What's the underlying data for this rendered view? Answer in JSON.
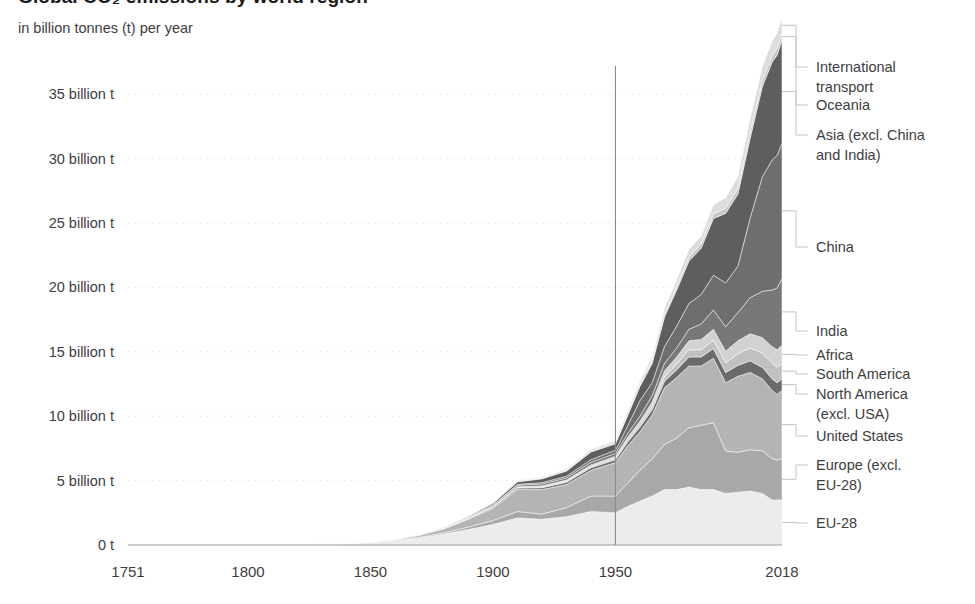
{
  "header": {
    "title": "Global CO₂ emissions by world region",
    "subtitle": "in billion tonnes (t) per year"
  },
  "axes": {
    "y_ticks": [
      {
        "value": 0,
        "label": "0 t"
      },
      {
        "value": 5,
        "label": "5 billion t"
      },
      {
        "value": 10,
        "label": "10 billion t"
      },
      {
        "value": 15,
        "label": "15 billion t"
      },
      {
        "value": 20,
        "label": "20 billion t"
      },
      {
        "value": 25,
        "label": "25 billion t"
      },
      {
        "value": 30,
        "label": "30 billion t"
      },
      {
        "value": 35,
        "label": "35 billion t"
      }
    ],
    "x_ticks": [
      {
        "value": 1751,
        "label": "1751"
      },
      {
        "value": 1800,
        "label": "1800"
      },
      {
        "value": 1850,
        "label": "1850"
      },
      {
        "value": 1900,
        "label": "1900"
      },
      {
        "value": 1950,
        "label": "1950"
      },
      {
        "value": 2018,
        "label": "2018"
      }
    ],
    "xlim": [
      1751,
      2018
    ],
    "ylim": [
      0,
      37.5
    ],
    "marker_year": 1950,
    "grid": true
  },
  "legend": {
    "position": "right",
    "entries": [
      {
        "key": "international_transport",
        "label": "International transport",
        "color": "#dcdcdc",
        "label_y": 72
      },
      {
        "key": "oceania",
        "label": "Oceania",
        "color": "#c7c7c7",
        "label_y": 110
      },
      {
        "key": "asia_other",
        "label": "Asia (excl. China and India)",
        "color": "#5e5e5e",
        "label_y": 140
      },
      {
        "key": "china",
        "label": "China",
        "color": "#6e6e6e",
        "label_y": 252
      },
      {
        "key": "india",
        "label": "India",
        "color": "#787878",
        "label_y": 336
      },
      {
        "key": "africa",
        "label": "Africa",
        "color": "#d2d2d2",
        "label_y": 360
      },
      {
        "key": "south_america",
        "label": "South America",
        "color": "#c0c0c0",
        "label_y": 379
      },
      {
        "key": "north_america",
        "label": "North America (excl. USA)",
        "color": "#6b6b6b",
        "label_y": 399
      },
      {
        "key": "united_states",
        "label": "United States",
        "color": "#b4b4b4",
        "label_y": 441
      },
      {
        "key": "europe_other",
        "label": "Europe (excl. EU-28)",
        "color": "#a8a8a8",
        "label_y": 470
      },
      {
        "key": "eu28",
        "label": "EU-28",
        "color": "#ececec",
        "label_y": 528
      }
    ]
  },
  "chart_data": {
    "type": "area",
    "title": "Global CO₂ emissions by world region",
    "subtitle": "in billion tonnes (t) per year",
    "xlabel": "",
    "ylabel": "in billion tonnes (t) per year",
    "xlim": [
      1751,
      2018
    ],
    "ylim": [
      0,
      37.5
    ],
    "stacked": true,
    "grid": true,
    "legend_position": "right",
    "x": [
      1751,
      1800,
      1820,
      1840,
      1850,
      1860,
      1870,
      1880,
      1890,
      1900,
      1910,
      1920,
      1930,
      1940,
      1950,
      1955,
      1960,
      1965,
      1970,
      1975,
      1980,
      1985,
      1990,
      1995,
      2000,
      2005,
      2010,
      2014,
      2016,
      2018
    ],
    "series": [
      {
        "name": "EU-28",
        "color": "#ececec",
        "values": [
          0.01,
          0.03,
          0.05,
          0.12,
          0.2,
          0.35,
          0.55,
          0.85,
          1.2,
          1.6,
          2.1,
          2.0,
          2.2,
          2.6,
          2.5,
          3.0,
          3.4,
          3.8,
          4.3,
          4.3,
          4.5,
          4.3,
          4.3,
          4.0,
          4.1,
          4.2,
          4.0,
          3.5,
          3.5,
          3.5
        ]
      },
      {
        "name": "Europe (excl. EU-28)",
        "color": "#a8a8a8",
        "values": [
          0.0,
          0.0,
          0.0,
          0.01,
          0.02,
          0.04,
          0.06,
          0.1,
          0.2,
          0.3,
          0.5,
          0.4,
          0.7,
          1.2,
          1.3,
          1.8,
          2.4,
          2.9,
          3.5,
          4.0,
          4.6,
          5.0,
          5.2,
          3.3,
          3.1,
          3.2,
          3.3,
          3.2,
          3.1,
          3.2
        ]
      },
      {
        "name": "United States",
        "color": "#b4b4b4",
        "values": [
          0.0,
          0.0,
          0.0,
          0.01,
          0.02,
          0.06,
          0.15,
          0.3,
          0.6,
          0.95,
          1.7,
          1.9,
          1.8,
          2.0,
          2.6,
          2.9,
          3.0,
          3.4,
          4.4,
          4.7,
          4.8,
          4.6,
          5.0,
          5.3,
          5.9,
          6.0,
          5.6,
          5.3,
          5.1,
          5.3
        ]
      },
      {
        "name": "North America (excl. USA)",
        "color": "#6b6b6b",
        "values": [
          0.0,
          0.0,
          0.0,
          0.0,
          0.0,
          0.01,
          0.02,
          0.03,
          0.05,
          0.08,
          0.12,
          0.15,
          0.17,
          0.2,
          0.22,
          0.3,
          0.35,
          0.4,
          0.5,
          0.6,
          0.7,
          0.7,
          0.75,
          0.8,
          0.85,
          0.9,
          0.9,
          0.9,
          0.9,
          0.9
        ]
      },
      {
        "name": "South America",
        "color": "#c0c0c0",
        "values": [
          0.0,
          0.0,
          0.0,
          0.0,
          0.0,
          0.0,
          0.01,
          0.01,
          0.02,
          0.03,
          0.05,
          0.07,
          0.08,
          0.1,
          0.12,
          0.16,
          0.2,
          0.26,
          0.35,
          0.45,
          0.55,
          0.55,
          0.65,
          0.75,
          0.9,
          1.0,
          1.1,
          1.2,
          1.2,
          1.2
        ]
      },
      {
        "name": "Africa",
        "color": "#d2d2d2",
        "values": [
          0.0,
          0.0,
          0.0,
          0.0,
          0.0,
          0.0,
          0.01,
          0.01,
          0.02,
          0.03,
          0.05,
          0.07,
          0.09,
          0.12,
          0.15,
          0.2,
          0.26,
          0.34,
          0.45,
          0.55,
          0.7,
          0.8,
          0.85,
          0.9,
          1.0,
          1.1,
          1.2,
          1.3,
          1.35,
          1.4
        ]
      },
      {
        "name": "India",
        "color": "#787878",
        "values": [
          0.0,
          0.0,
          0.0,
          0.0,
          0.0,
          0.01,
          0.02,
          0.03,
          0.05,
          0.08,
          0.12,
          0.15,
          0.17,
          0.2,
          0.22,
          0.3,
          0.4,
          0.5,
          0.6,
          0.7,
          0.9,
          1.2,
          1.5,
          1.9,
          2.2,
          2.8,
          3.6,
          4.4,
          4.8,
          5.2
        ]
      },
      {
        "name": "China",
        "color": "#6e6e6e",
        "values": [
          0.0,
          0.0,
          0.0,
          0.0,
          0.0,
          0.0,
          0.01,
          0.02,
          0.03,
          0.04,
          0.07,
          0.1,
          0.13,
          0.2,
          0.25,
          0.6,
          1.2,
          1.0,
          1.3,
          1.7,
          2.0,
          2.3,
          2.7,
          3.4,
          3.6,
          6.2,
          8.9,
          10.1,
          10.3,
          10.5
        ]
      },
      {
        "name": "Asia (excl. China and India)",
        "color": "#5e5e5e",
        "values": [
          0.0,
          0.0,
          0.0,
          0.0,
          0.01,
          0.01,
          0.02,
          0.04,
          0.07,
          0.12,
          0.2,
          0.3,
          0.4,
          0.6,
          0.5,
          0.8,
          1.1,
          1.5,
          2.3,
          2.8,
          3.3,
          3.6,
          4.4,
          5.4,
          5.6,
          6.2,
          7.0,
          7.6,
          7.8,
          8.0
        ]
      },
      {
        "name": "Oceania",
        "color": "#c7c7c7",
        "values": [
          0.0,
          0.0,
          0.0,
          0.0,
          0.0,
          0.0,
          0.01,
          0.01,
          0.02,
          0.03,
          0.04,
          0.05,
          0.06,
          0.08,
          0.09,
          0.11,
          0.14,
          0.17,
          0.22,
          0.26,
          0.3,
          0.33,
          0.36,
          0.4,
          0.44,
          0.47,
          0.5,
          0.52,
          0.53,
          0.55
        ]
      },
      {
        "name": "International transport",
        "color": "#dcdcdc",
        "values": [
          0.0,
          0.0,
          0.0,
          0.0,
          0.0,
          0.0,
          0.0,
          0.01,
          0.02,
          0.03,
          0.05,
          0.07,
          0.1,
          0.12,
          0.15,
          0.2,
          0.26,
          0.33,
          0.45,
          0.52,
          0.6,
          0.6,
          0.7,
          0.8,
          0.9,
          1.0,
          1.05,
          1.1,
          1.15,
          1.2
        ]
      }
    ]
  }
}
